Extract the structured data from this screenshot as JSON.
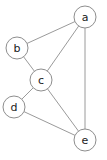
{
  "diagram": {
    "type": "undirected-graph",
    "title": "",
    "background_color": "#ffffff",
    "node_fill_color": "#ffffff",
    "node_stroke_color": "#8e8e8e",
    "edge_color": "#9a9a9a",
    "label_color": "#1a1a1a",
    "node_radius": 11,
    "nodes": [
      {
        "id": "a",
        "label": "a",
        "x": 85,
        "y": 17
      },
      {
        "id": "b",
        "label": "b",
        "x": 17,
        "y": 48
      },
      {
        "id": "c",
        "label": "c",
        "x": 41,
        "y": 80
      },
      {
        "id": "d",
        "label": "d",
        "x": 14,
        "y": 107
      },
      {
        "id": "e",
        "label": "e",
        "x": 85,
        "y": 140
      }
    ],
    "edges": [
      {
        "source": "a",
        "target": "b"
      },
      {
        "source": "a",
        "target": "c"
      },
      {
        "source": "a",
        "target": "e"
      },
      {
        "source": "b",
        "target": "c"
      },
      {
        "source": "c",
        "target": "d"
      },
      {
        "source": "c",
        "target": "e"
      },
      {
        "source": "d",
        "target": "e"
      }
    ]
  }
}
